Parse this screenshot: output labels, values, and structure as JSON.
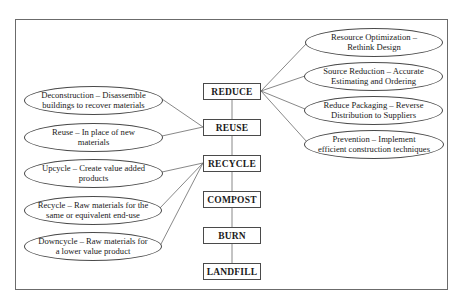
{
  "diagram": {
    "hierarchy": [
      {
        "id": "reduce",
        "label": "REDUCE"
      },
      {
        "id": "reuse",
        "label": "REUSE"
      },
      {
        "id": "recycle",
        "label": "RECYCLE"
      },
      {
        "id": "compost",
        "label": "COMPOST"
      },
      {
        "id": "burn",
        "label": "BURN"
      },
      {
        "id": "landfill",
        "label": "LANDFILL"
      }
    ],
    "reduce_strategies": [
      {
        "line1": "Resource Optimization –",
        "line2": "Rethink Design"
      },
      {
        "line1": "Source Reduction – Accurate",
        "line2": "Estimating and Ordering"
      },
      {
        "line1": "Reduce Packaging – Reverse",
        "line2": "Distribution to Suppliers"
      },
      {
        "line1": "Prevention – Implement",
        "line2": "efficient construction techniques"
      }
    ],
    "reuse_strategies": [
      {
        "line1": "Deconstruction – Disassemble",
        "line2": "buildings to recover materials"
      },
      {
        "line1": "Reuse – In place of new",
        "line2": "materials"
      }
    ],
    "recycle_strategies": [
      {
        "line1": "Upcycle – Create value added",
        "line2": "products"
      },
      {
        "line1": "Recycle – Raw materials for the",
        "line2": "same or equivalent end-use"
      },
      {
        "line1": "Downcycle – Raw materials for",
        "line2": "a lower value product"
      }
    ],
    "colors": {
      "stroke": "#4a4a4a",
      "frame": "#6b6b6b",
      "text": "#1a1a1a",
      "background": "#ffffff"
    }
  }
}
